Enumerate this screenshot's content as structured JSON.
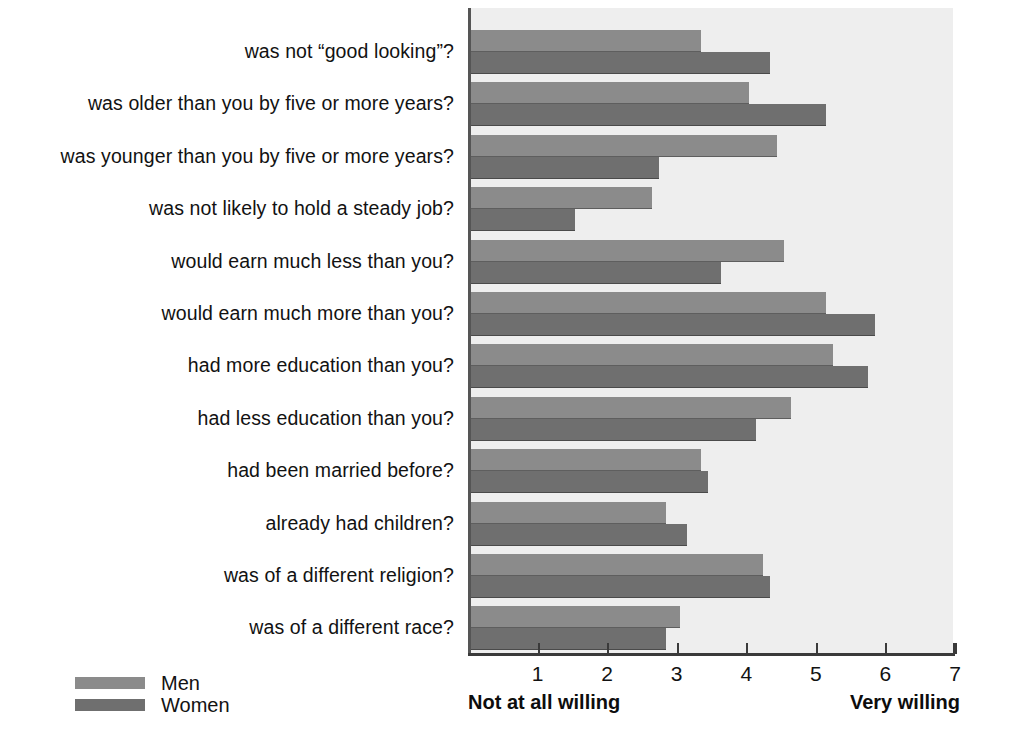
{
  "chart_data": {
    "type": "bar",
    "orientation": "horizontal",
    "title": "",
    "subtitle": "",
    "xlabel": "",
    "ylabel": "",
    "xlim": [
      0,
      7
    ],
    "xticks": [
      "1",
      "2",
      "3",
      "4",
      "5",
      "6",
      "7"
    ],
    "xtick_values": [
      1,
      2,
      3,
      4,
      5,
      6,
      7
    ],
    "grid": false,
    "axis_anchor_low": "Not at all willing",
    "axis_anchor_high": "Very willing",
    "legend_position": "bottom-left",
    "categories": [
      "was not “good looking”?",
      "was older than you by five or more years?",
      "was younger than you by five or more years?",
      "was not likely to hold a steady job?",
      "would earn much less than you?",
      "would earn much more than you?",
      "had more education than you?",
      "had less education than you?",
      "had been married before?",
      "already had children?",
      "was of a different religion?",
      "was of a different race?"
    ],
    "series": [
      {
        "name": "Men",
        "color": "#8b8b8b",
        "values": [
          3.3,
          4.0,
          4.4,
          2.6,
          4.5,
          5.1,
          5.2,
          4.6,
          3.3,
          2.8,
          4.2,
          3.0
        ]
      },
      {
        "name": "Women",
        "color": "#6f6f6f",
        "values": [
          4.3,
          5.1,
          2.7,
          1.5,
          3.6,
          5.8,
          5.7,
          4.1,
          3.4,
          3.1,
          4.3,
          2.8
        ]
      }
    ]
  },
  "legend": {
    "items": [
      {
        "label": "Men",
        "color": "#8b8b8b"
      },
      {
        "label": "Women",
        "color": "#6f6f6f"
      }
    ]
  },
  "axis": {
    "anchor_low": "Not at all willing",
    "anchor_high": "Very willing",
    "ticks": [
      "1",
      "2",
      "3",
      "4",
      "5",
      "6",
      "7"
    ]
  },
  "colors": {
    "plot_background": "#eeeeee",
    "page_background": "#ffffff",
    "men_bar": "#8b8b8b",
    "women_bar": "#6f6f6f",
    "axis": "#3a3a3a",
    "text": "#121212"
  }
}
